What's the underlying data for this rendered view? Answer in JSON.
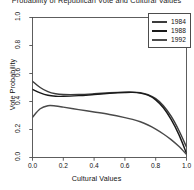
{
  "chart_data": {
    "type": "line",
    "title": "Probability of Republican Vote and Cultural Values",
    "xlabel": "Cultural Values",
    "ylabel": "Vote Probability",
    "xlim": [
      0,
      1
    ],
    "ylim": [
      0,
      1
    ],
    "xticks": [
      "0.0",
      "0.2",
      "0.4",
      "0.6",
      "0.8",
      "1.0"
    ],
    "yticks": [
      "0.0",
      "0.2",
      "0.4",
      "0.6",
      "0.8",
      "1.0"
    ],
    "grid": false,
    "legend_position": "top-right",
    "legend_title": "",
    "series": [
      {
        "name": "1984",
        "color": "#3c3c3c",
        "x": [
          0.0,
          0.05,
          0.1,
          0.15,
          0.2,
          0.3,
          0.4,
          0.5,
          0.6,
          0.65,
          0.7,
          0.75,
          0.8,
          0.85,
          0.9,
          0.95,
          1.0
        ],
        "values": [
          0.545,
          0.5,
          0.47,
          0.455,
          0.45,
          0.45,
          0.455,
          0.462,
          0.467,
          0.467,
          0.462,
          0.448,
          0.42,
          0.37,
          0.295,
          0.195,
          0.075
        ]
      },
      {
        "name": "1988",
        "color": "#1a1a1a",
        "x": [
          0.0,
          0.05,
          0.1,
          0.15,
          0.2,
          0.3,
          0.4,
          0.5,
          0.6,
          0.65,
          0.7,
          0.75,
          0.8,
          0.85,
          0.9,
          0.95,
          1.0
        ],
        "values": [
          0.487,
          0.462,
          0.445,
          0.438,
          0.437,
          0.442,
          0.45,
          0.458,
          0.464,
          0.465,
          0.46,
          0.445,
          0.412,
          0.355,
          0.272,
          0.165,
          0.03
        ]
      },
      {
        "name": "1992",
        "color": "#4a4a4a",
        "x": [
          0.0,
          0.05,
          0.1,
          0.15,
          0.2,
          0.3,
          0.4,
          0.5,
          0.6,
          0.65,
          0.7,
          0.75,
          0.8,
          0.85,
          0.9,
          0.95,
          1.0
        ],
        "values": [
          0.288,
          0.348,
          0.37,
          0.368,
          0.36,
          0.342,
          0.325,
          0.307,
          0.285,
          0.272,
          0.255,
          0.232,
          0.203,
          0.168,
          0.128,
          0.08,
          0.022
        ]
      }
    ]
  },
  "legend": {
    "items": [
      {
        "label": "1984",
        "color": "#3c3c3c"
      },
      {
        "label": "1988",
        "color": "#1a1a1a"
      },
      {
        "label": "1992",
        "color": "#4a4a4a"
      }
    ]
  },
  "axes": {
    "x_label": "Cultural Values",
    "y_label": "Vote Probability",
    "x_tick_labels": [
      "0.0",
      "0.2",
      "0.4",
      "0.6",
      "0.8",
      "1.0"
    ],
    "y_tick_labels": [
      "0.0",
      "0.2",
      "0.4",
      "0.6",
      "0.8",
      "1.0"
    ]
  },
  "style": {
    "background": "#ffffff",
    "axis_color": "#4d4d4d",
    "text_color": "#111111"
  }
}
